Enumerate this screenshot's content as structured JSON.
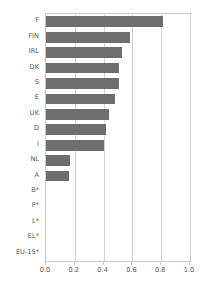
{
  "chart_data": {
    "type": "bar",
    "orientation": "horizontal",
    "title": "",
    "subtitle": "",
    "xlabel": "",
    "ylabel": "",
    "xlim": [
      0.0,
      1.0
    ],
    "xticks": [
      "0.0",
      "0.2",
      "0.4",
      "0.6",
      "0.8",
      "1.0"
    ],
    "xtick_values": [
      0.0,
      0.2,
      0.4,
      0.6,
      0.8,
      1.0
    ],
    "grid": "vertical",
    "legend": "none",
    "bar_color": "#6e6e6e",
    "grid_color": "#d4d4d4",
    "axis_color": "#c9c9c9",
    "text_color": "#555555",
    "categories": [
      "F",
      "FIN",
      "IRL",
      "DK",
      "S",
      "E",
      "UK",
      "D",
      "I",
      "NL",
      "A",
      "B*",
      "P*",
      "L*",
      "EL*",
      "EU-15*"
    ],
    "values": [
      0.81,
      0.58,
      0.53,
      0.51,
      0.51,
      0.48,
      0.44,
      0.42,
      0.4,
      0.17,
      0.16,
      0.0,
      0.0,
      0.0,
      0.0,
      0.0
    ],
    "annotations": [
      "* no data available"
    ]
  }
}
